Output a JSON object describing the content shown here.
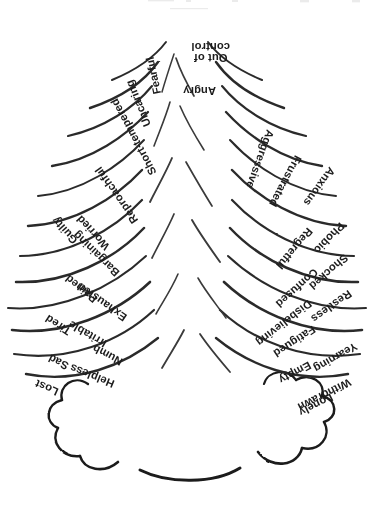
{
  "figure": {
    "orientation": "upside-down",
    "background_color": "#ffffff",
    "ink_color": "#1c1c1c"
  },
  "cloud": {
    "name": "storm-cloud",
    "lobes": 7
  },
  "labels": {
    "left": [
      {
        "text": "Lonely",
        "x": 44,
        "y": 118,
        "rot": -27
      },
      {
        "text": "Withdrawn",
        "x": 26,
        "y": 133,
        "rot": -27
      },
      {
        "text": "Empty",
        "x": 66,
        "y": 150,
        "rot": -28
      },
      {
        "text": "Yearning",
        "x": 20,
        "y": 169,
        "rot": -30
      },
      {
        "text": "Fatigued",
        "x": 62,
        "y": 186,
        "rot": -33
      },
      {
        "text": "Disbelieving",
        "x": 66,
        "y": 212,
        "rot": -38
      },
      {
        "text": "Restless",
        "x": 26,
        "y": 222,
        "rot": -36
      },
      {
        "text": "Confused",
        "x": 60,
        "y": 244,
        "rot": -42
      },
      {
        "text": "Shocked",
        "x": 30,
        "y": 258,
        "rot": -41
      },
      {
        "text": "Regretful",
        "x": 66,
        "y": 285,
        "rot": -50
      },
      {
        "text": "Phobic",
        "x": 34,
        "y": 290,
        "rot": -46
      },
      {
        "text": "Anxious",
        "x": 44,
        "y": 346,
        "rot": -54
      },
      {
        "text": "Frustrated",
        "x": 78,
        "y": 358,
        "rot": -62
      },
      {
        "text": "Aggressive",
        "x": 106,
        "y": 384,
        "rot": -70
      }
    ],
    "right": [
      {
        "text": "Lost",
        "x": 318,
        "y": 122,
        "rot": 24
      },
      {
        "text": "Helpless",
        "x": 262,
        "y": 130,
        "rot": 22
      },
      {
        "text": "Sad",
        "x": 308,
        "y": 148,
        "rot": 26
      },
      {
        "text": "Numb",
        "x": 254,
        "y": 152,
        "rot": 28
      },
      {
        "text": "Irritable",
        "x": 270,
        "y": 170,
        "rot": 30
      },
      {
        "text": "Tired",
        "x": 306,
        "y": 182,
        "rot": 33
      },
      {
        "text": "Exhausted",
        "x": 250,
        "y": 196,
        "rot": 35
      },
      {
        "text": "Pained",
        "x": 280,
        "y": 214,
        "rot": 39
      },
      {
        "text": "Bargaining",
        "x": 258,
        "y": 240,
        "rot": 44
      },
      {
        "text": "Worried",
        "x": 268,
        "y": 266,
        "rot": 47
      },
      {
        "text": "Guilty",
        "x": 300,
        "y": 272,
        "rot": 48
      },
      {
        "text": "Reproachful",
        "x": 240,
        "y": 292,
        "rot": 55
      },
      {
        "text": "Short-tempered",
        "x": 222,
        "y": 340,
        "rot": 62
      },
      {
        "text": "Uncaring",
        "x": 228,
        "y": 388,
        "rot": 68
      }
    ],
    "center": [
      {
        "text": "Angry",
        "x": 160,
        "y": 424,
        "rot": 0
      },
      {
        "text": "Fearful",
        "x": 218,
        "y": 420,
        "rot": 78
      }
    ],
    "center_multiline": [
      {
        "line1": "Out of",
        "line2": "control",
        "x": 146,
        "y": 462,
        "rot": 0
      }
    ]
  }
}
